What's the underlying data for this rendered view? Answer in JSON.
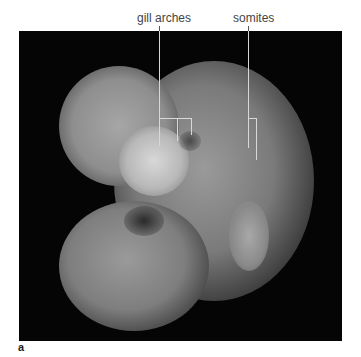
{
  "figure": {
    "panel_letter": "a",
    "labels": [
      {
        "id": "gill-arches",
        "text": "gill arches"
      },
      {
        "id": "somites",
        "text": "somites"
      }
    ]
  }
}
